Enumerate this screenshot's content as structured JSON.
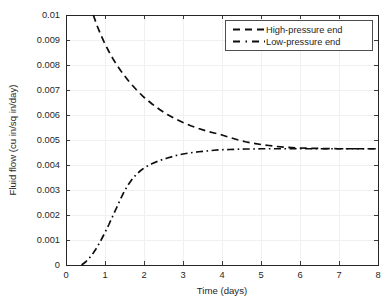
{
  "chart_data": {
    "type": "line",
    "title": "",
    "xlabel": "Time (days)",
    "ylabel": "Fluid flow (cu in/sq in/day)",
    "xlim": [
      0,
      8
    ],
    "ylim": [
      0,
      0.01
    ],
    "xticks": [
      "0",
      "1",
      "2",
      "3",
      "4",
      "5",
      "6",
      "7",
      "8"
    ],
    "yticks": [
      "0",
      "0.001",
      "0.002",
      "0.003",
      "0.004",
      "0.005",
      "0.006",
      "0.007",
      "0.008",
      "0.009",
      "0.01"
    ],
    "grid": true,
    "legend_position": "top-right",
    "series": [
      {
        "name": "High-pressure end",
        "style": "dashed",
        "color": "#0d0d0d",
        "x": [
          0.7,
          0.8,
          0.9,
          1.0,
          1.1,
          1.2,
          1.3,
          1.4,
          1.5,
          1.6,
          1.7,
          1.8,
          1.9,
          2.0,
          2.2,
          2.4,
          2.6,
          2.8,
          3.0,
          3.2,
          3.4,
          3.6,
          3.8,
          4.0,
          4.2,
          4.4,
          4.6,
          4.8,
          5.0,
          5.2,
          5.4,
          5.6,
          6.0,
          6.5,
          7.0,
          7.5,
          8.0
        ],
        "y": [
          0.01,
          0.00956,
          0.00918,
          0.00884,
          0.00854,
          0.00826,
          0.00801,
          0.00778,
          0.00757,
          0.00737,
          0.00719,
          0.00702,
          0.00686,
          0.00671,
          0.00645,
          0.00622,
          0.00602,
          0.00585,
          0.0057,
          0.00557,
          0.00546,
          0.00536,
          0.00528,
          0.0052,
          0.0051,
          0.00501,
          0.00493,
          0.00487,
          0.00482,
          0.00478,
          0.00474,
          0.00471,
          0.00468,
          0.00466,
          0.00465,
          0.00465,
          0.00465
        ]
      },
      {
        "name": "Low-pressure end",
        "style": "dash-dot",
        "color": "#0d0d0d",
        "x": [
          0.4,
          0.5,
          0.6,
          0.7,
          0.8,
          0.9,
          1.0,
          1.1,
          1.2,
          1.3,
          1.4,
          1.5,
          1.6,
          1.7,
          1.8,
          1.9,
          2.0,
          2.2,
          2.4,
          2.6,
          2.8,
          3.0,
          3.2,
          3.4,
          3.6,
          3.8,
          4.0,
          4.2,
          4.4,
          4.6,
          4.8,
          5.0,
          5.2,
          5.5,
          6.0,
          6.5,
          7.0,
          7.5,
          8.0
        ],
        "y": [
          0.0,
          0.00012,
          0.00028,
          0.00048,
          0.00072,
          0.001,
          0.0013,
          0.00162,
          0.00196,
          0.0023,
          0.00264,
          0.00296,
          0.00322,
          0.00344,
          0.00362,
          0.00376,
          0.00388,
          0.00405,
          0.00418,
          0.00428,
          0.00437,
          0.00444,
          0.00449,
          0.00453,
          0.00456,
          0.00459,
          0.00461,
          0.00462,
          0.00463,
          0.00464,
          0.00464,
          0.00465,
          0.00465,
          0.00465,
          0.00465,
          0.00465,
          0.00465,
          0.00465,
          0.00465
        ]
      }
    ]
  },
  "legend": {
    "entries": [
      {
        "label": "High-pressure end"
      },
      {
        "label": "Low-pressure end"
      }
    ]
  },
  "axes": {
    "x_title": "Time (days)",
    "y_title": "Fluid flow (cu in/sq in/day)"
  }
}
